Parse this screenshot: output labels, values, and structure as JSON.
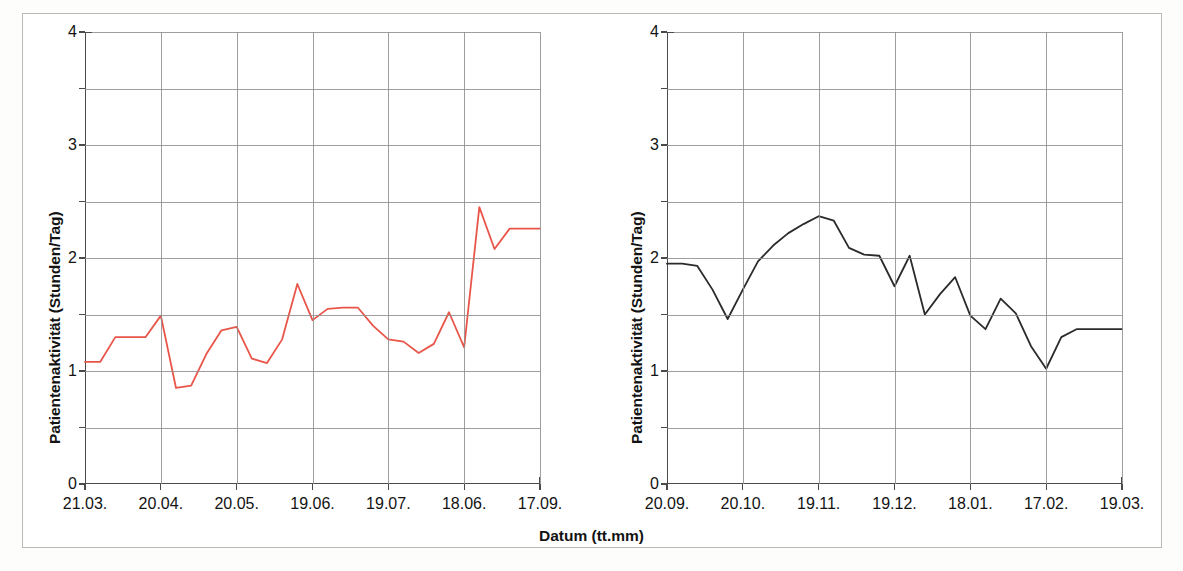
{
  "figure": {
    "background": "#ffffff",
    "frame_color": "#b9b9b9",
    "xlabel": "Datum (tt.mm)",
    "ylabel": "Patientenaktivität (Stunden/Tag)"
  },
  "axis": {
    "y_ticks": [
      "0",
      "1",
      "2",
      "3",
      "4"
    ],
    "y_minor": [
      "0.5",
      "1.5",
      "2.5",
      "3.5"
    ],
    "ylim": [
      0,
      4
    ]
  },
  "chart_data": [
    {
      "type": "line",
      "id": "left",
      "title": "",
      "xlabel": "Datum (tt.mm)",
      "ylabel": "Patientenaktivität (Stunden/Tag)",
      "color": "#e8564a",
      "ylim": [
        0,
        4
      ],
      "grid": true,
      "legend": "none",
      "tick_labels": [
        "21.03.",
        "20.04.",
        "20.05.",
        "19.06.",
        "19.07.",
        "18.06.",
        "17.09."
      ],
      "tick_positions": [
        0,
        30,
        60,
        90,
        120,
        150,
        180
      ],
      "x": [
        0,
        6,
        12,
        18,
        24,
        30,
        36,
        42,
        48,
        54,
        60,
        66,
        72,
        78,
        84,
        90,
        96,
        102,
        108,
        114,
        120,
        126,
        132,
        138,
        144,
        150,
        156,
        162,
        168,
        174,
        180
      ],
      "values": [
        1.08,
        1.08,
        1.3,
        1.3,
        1.3,
        1.49,
        0.85,
        0.87,
        1.15,
        1.36,
        1.39,
        1.11,
        1.07,
        1.28,
        1.77,
        1.45,
        1.55,
        1.56,
        1.56,
        1.4,
        1.28,
        1.26,
        1.16,
        1.24,
        1.52,
        1.21,
        2.45,
        2.08,
        2.26,
        2.26,
        2.26
      ]
    },
    {
      "type": "line",
      "id": "right",
      "title": "",
      "xlabel": "Datum (tt.mm)",
      "ylabel": "Patientenaktivität (Stunden/Tag)",
      "color": "#2b2b2b",
      "ylim": [
        0,
        4
      ],
      "grid": true,
      "legend": "none",
      "tick_labels": [
        "20.09.",
        "20.10.",
        "19.11.",
        "19.12.",
        "18.01.",
        "17.02.",
        "19.03."
      ],
      "tick_positions": [
        0,
        30,
        60,
        90,
        120,
        150,
        180
      ],
      "x": [
        0,
        6,
        12,
        18,
        24,
        30,
        36,
        42,
        48,
        54,
        60,
        66,
        72,
        78,
        84,
        90,
        96,
        102,
        108,
        114,
        120,
        126,
        132,
        138,
        144,
        150,
        156,
        162,
        168,
        174,
        180
      ],
      "values": [
        1.95,
        1.95,
        1.93,
        1.72,
        1.46,
        1.72,
        1.97,
        2.11,
        2.22,
        2.3,
        2.37,
        2.33,
        2.09,
        2.03,
        2.02,
        1.75,
        2.02,
        1.5,
        1.68,
        1.83,
        1.49,
        1.37,
        1.64,
        1.51,
        1.22,
        1.02,
        1.3,
        1.37,
        1.37,
        1.37,
        1.37
      ]
    }
  ]
}
